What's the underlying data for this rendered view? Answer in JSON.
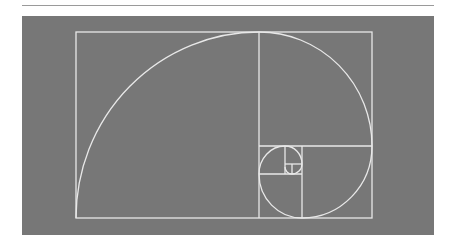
{
  "figure": {
    "panel_color": "#777777",
    "line_color": "#e8e8e8",
    "rule_color": "#9a9a9a"
  }
}
